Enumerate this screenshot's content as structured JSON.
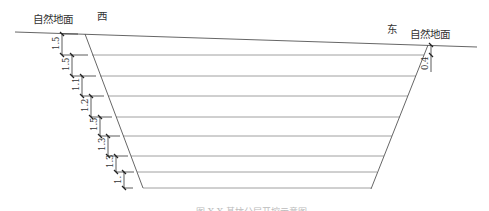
{
  "labels": {
    "ground_left": "自然地面",
    "ground_right": "自然地面",
    "west": "西",
    "east": "东",
    "caption": "图 X-X 基坑分层开挖示意图"
  },
  "geometry": {
    "ground_line": {
      "x1": 15,
      "y1": 32,
      "x2": 477,
      "y2": 47
    },
    "left_slope": {
      "x1": 85,
      "y1": 34,
      "x2": 143,
      "y2": 188
    },
    "right_slope": {
      "x1": 428,
      "y1": 45,
      "x2": 371,
      "y2": 189
    },
    "layer_lines_y": [
      55,
      76,
      96,
      117,
      136,
      156,
      172,
      188
    ]
  },
  "left_dimensions": [
    {
      "label": "1.5",
      "y_top": 34,
      "y_bottom": 55,
      "x": 62
    },
    {
      "label": "1.5",
      "y_top": 55,
      "y_bottom": 76,
      "x": 70
    },
    {
      "label": "1.1",
      "y_top": 76,
      "y_bottom": 96,
      "x": 78
    },
    {
      "label": "1.2",
      "y_top": 96,
      "y_bottom": 117,
      "x": 86
    },
    {
      "label": "1.5",
      "y_top": 117,
      "y_bottom": 136,
      "x": 94
    },
    {
      "label": "1.3",
      "y_top": 136,
      "y_bottom": 156,
      "x": 102
    },
    {
      "label": "1.3",
      "y_top": 156,
      "y_bottom": 172,
      "x": 110
    },
    {
      "label": "1.",
      "y_top": 172,
      "y_bottom": 188,
      "x": 118
    }
  ],
  "right_dimensions": [
    {
      "label": "0.4",
      "y_top": 45,
      "y_bottom": 55,
      "x": 431
    }
  ]
}
